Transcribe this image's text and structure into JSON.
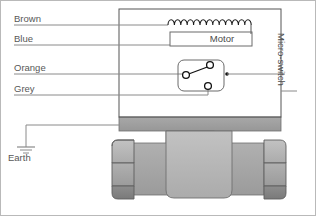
{
  "diagram": {
    "labels": {
      "brown": "Brown",
      "blue": "Blue",
      "orange": "Orange",
      "grey": "Grey",
      "earth": "Earth",
      "motor": "Motor",
      "micro_switch": "Micro-switch"
    },
    "colors": {
      "wire_line": "#8a8a8a",
      "enclosure_border": "#555555",
      "text": "#575757",
      "body_light": "#b5b5b5",
      "body_mid": "#a0a0a0",
      "body_dark": "#7e7e7e",
      "flange": "#9a9a9a",
      "outline": "#4a4a4a",
      "frame": "#b9b9b9",
      "coil": "#1a1a1a"
    },
    "components": {
      "enclosure": {
        "name": "control-head-enclosure"
      },
      "motor_coil": {
        "name": "motor-coil",
        "loops": 13
      },
      "motor_box": {
        "name": "motor-box"
      },
      "micro_switch": {
        "name": "micro-switch-symbol",
        "terminals": 3
      },
      "earth_symbol": {
        "name": "earth-ground-symbol",
        "bars": 3
      },
      "valve_body": {
        "name": "valve-body"
      },
      "hex_nut_left": {
        "name": "hex-nut-left"
      },
      "hex_nut_right": {
        "name": "hex-nut-right"
      },
      "flange_bar": {
        "name": "mounting-flange"
      }
    },
    "wires": [
      {
        "name": "wire-brown",
        "label": "Brown",
        "to": "motor-coil"
      },
      {
        "name": "wire-blue",
        "label": "Blue",
        "to": "motor-box"
      },
      {
        "name": "wire-orange",
        "label": "Orange",
        "to": "micro-switch-common"
      },
      {
        "name": "wire-grey",
        "label": "Grey",
        "to": "micro-switch-normally-open"
      },
      {
        "name": "wire-earth",
        "label": "Earth",
        "to": "enclosure-chassis"
      }
    ]
  }
}
